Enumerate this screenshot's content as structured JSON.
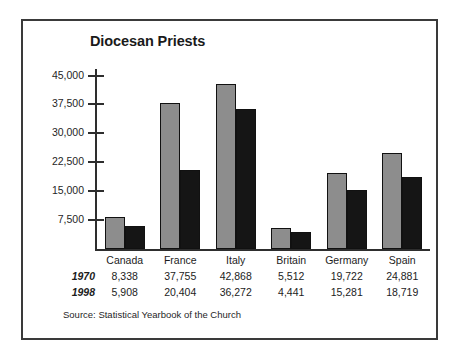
{
  "chart_data": {
    "type": "bar",
    "title": "Diocesan Priests",
    "xlabel": "",
    "ylabel": "",
    "ylim": [
      0,
      48000
    ],
    "yticks": [
      "7,500",
      "15,000",
      "22,500",
      "30,000",
      "37,500",
      "45,000"
    ],
    "ytick_values": [
      7500,
      15000,
      22500,
      30000,
      37500,
      45000
    ],
    "grid": false,
    "legend_position": "none",
    "categories": [
      "Canada",
      "France",
      "Italy",
      "Britain",
      "Germany",
      "Spain"
    ],
    "series": [
      {
        "name": "1970",
        "color": "#8d8d8d",
        "values": [
          8338,
          37755,
          42868,
          5512,
          19722,
          24881
        ],
        "labels": [
          "8,338",
          "37,755",
          "42,868",
          "5,512",
          "19,722",
          "24,881"
        ]
      },
      {
        "name": "1998",
        "color": "#151515",
        "values": [
          5908,
          20404,
          36272,
          4441,
          15281,
          18719
        ],
        "labels": [
          "5,908",
          "20,404",
          "36,272",
          "4,441",
          "15,281",
          "18,719"
        ]
      }
    ],
    "source": "Source: Statistical Yearbook of the Church"
  },
  "colors": {
    "frame": "#3a3a3a",
    "axis": "#2e2e2e",
    "series_1970": "#8d8d8d",
    "series_1998": "#151515",
    "text": "#1c1c1c",
    "background": "#ffffff"
  }
}
